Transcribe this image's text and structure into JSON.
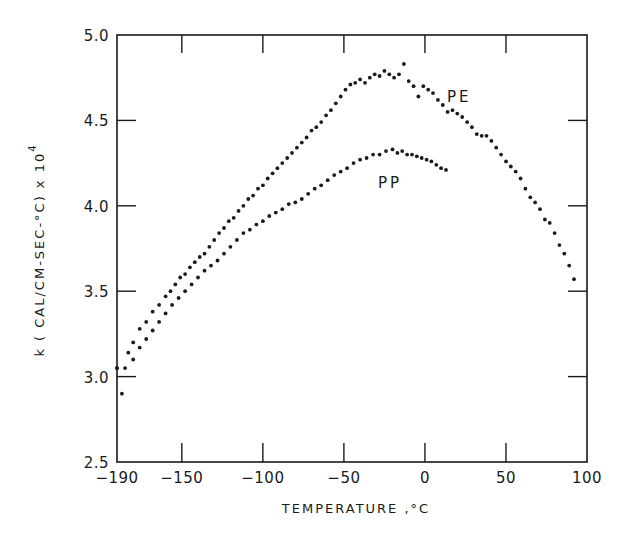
{
  "chart_data": {
    "type": "scatter",
    "title": "",
    "xlabel": "TEMPERATURE, °C",
    "ylabel": "k (CAL/CM-SEC-°C) x 10",
    "ylabel_superscript": "4",
    "xlim": [
      -190,
      100
    ],
    "ylim": [
      2.5,
      5.0
    ],
    "xticks": [
      -190,
      -150,
      -100,
      -50,
      0,
      50,
      100
    ],
    "xtick_labels": [
      "-190",
      "-150",
      "-100",
      "-50",
      "0",
      "50",
      "100"
    ],
    "yticks": [
      2.5,
      3.0,
      3.5,
      4.0,
      4.5,
      5.0
    ],
    "ytick_labels": [
      "2.5",
      "3.0",
      "3.5",
      "4.0",
      "4.5",
      "5.0"
    ],
    "grid": false,
    "legend": "inline labels",
    "series": [
      {
        "name": "PE",
        "label_position": {
          "x": 12,
          "y": 4.68
        },
        "points": [
          [
            -190,
            3.05
          ],
          [
            -187,
            2.9
          ],
          [
            -183,
            3.14
          ],
          [
            -180,
            3.2
          ],
          [
            -176,
            3.28
          ],
          [
            -172,
            3.32
          ],
          [
            -168,
            3.38
          ],
          [
            -164,
            3.42
          ],
          [
            -160,
            3.47
          ],
          [
            -157,
            3.5
          ],
          [
            -154,
            3.54
          ],
          [
            -151,
            3.58
          ],
          [
            -148,
            3.6
          ],
          [
            -145,
            3.64
          ],
          [
            -142,
            3.67
          ],
          [
            -139,
            3.7
          ],
          [
            -136,
            3.72
          ],
          [
            -133,
            3.76
          ],
          [
            -130,
            3.8
          ],
          [
            -127,
            3.84
          ],
          [
            -124,
            3.87
          ],
          [
            -121,
            3.91
          ],
          [
            -118,
            3.93
          ],
          [
            -115,
            3.97
          ],
          [
            -112,
            4.0
          ],
          [
            -109,
            4.04
          ],
          [
            -106,
            4.06
          ],
          [
            -103,
            4.1
          ],
          [
            -100,
            4.12
          ],
          [
            -97,
            4.16
          ],
          [
            -94,
            4.19
          ],
          [
            -91,
            4.22
          ],
          [
            -88,
            4.25
          ],
          [
            -85,
            4.28
          ],
          [
            -82,
            4.31
          ],
          [
            -79,
            4.34
          ],
          [
            -76,
            4.37
          ],
          [
            -73,
            4.4
          ],
          [
            -70,
            4.44
          ],
          [
            -67,
            4.46
          ],
          [
            -64,
            4.49
          ],
          [
            -61,
            4.53
          ],
          [
            -58,
            4.56
          ],
          [
            -55,
            4.6
          ],
          [
            -52,
            4.64
          ],
          [
            -49,
            4.68
          ],
          [
            -46,
            4.71
          ],
          [
            -43,
            4.72
          ],
          [
            -40,
            4.74
          ],
          [
            -37,
            4.72
          ],
          [
            -34,
            4.75
          ],
          [
            -31,
            4.77
          ],
          [
            -28,
            4.76
          ],
          [
            -25,
            4.79
          ],
          [
            -22,
            4.77
          ],
          [
            -19,
            4.75
          ],
          [
            -16,
            4.77
          ],
          [
            -13,
            4.83
          ],
          [
            -10,
            4.73
          ],
          [
            -7,
            4.7
          ],
          [
            -4,
            4.64
          ],
          [
            -1,
            4.7
          ],
          [
            2,
            4.68
          ],
          [
            5,
            4.66
          ],
          [
            8,
            4.62
          ],
          [
            11,
            4.59
          ],
          [
            14,
            4.55
          ],
          [
            17,
            4.56
          ],
          [
            20,
            4.54
          ],
          [
            23,
            4.52
          ],
          [
            26,
            4.49
          ],
          [
            29,
            4.46
          ],
          [
            32,
            4.42
          ],
          [
            35,
            4.41
          ],
          [
            38,
            4.41
          ],
          [
            41,
            4.38
          ],
          [
            44,
            4.34
          ],
          [
            47,
            4.3
          ],
          [
            50,
            4.26
          ],
          [
            53,
            4.23
          ],
          [
            56,
            4.2
          ],
          [
            59,
            4.16
          ],
          [
            62,
            4.1
          ],
          [
            65,
            4.05
          ],
          [
            68,
            4.02
          ],
          [
            71,
            3.98
          ],
          [
            74,
            3.92
          ],
          [
            77,
            3.9
          ],
          [
            80,
            3.84
          ],
          [
            83,
            3.77
          ],
          [
            86,
            3.72
          ],
          [
            89,
            3.65
          ],
          [
            92,
            3.57
          ]
        ]
      },
      {
        "name": "PP",
        "label_position": {
          "x": -23,
          "y": 4.15
        },
        "points": [
          [
            -190,
            3.05
          ],
          [
            -185,
            3.05
          ],
          [
            -180,
            3.1
          ],
          [
            -176,
            3.17
          ],
          [
            -172,
            3.22
          ],
          [
            -168,
            3.27
          ],
          [
            -164,
            3.32
          ],
          [
            -160,
            3.37
          ],
          [
            -156,
            3.42
          ],
          [
            -152,
            3.46
          ],
          [
            -148,
            3.5
          ],
          [
            -144,
            3.54
          ],
          [
            -140,
            3.58
          ],
          [
            -136,
            3.62
          ],
          [
            -132,
            3.65
          ],
          [
            -128,
            3.68
          ],
          [
            -124,
            3.72
          ],
          [
            -120,
            3.76
          ],
          [
            -116,
            3.8
          ],
          [
            -112,
            3.84
          ],
          [
            -108,
            3.86
          ],
          [
            -104,
            3.89
          ],
          [
            -100,
            3.91
          ],
          [
            -96,
            3.94
          ],
          [
            -92,
            3.96
          ],
          [
            -88,
            3.98
          ],
          [
            -84,
            4.01
          ],
          [
            -80,
            4.02
          ],
          [
            -76,
            4.04
          ],
          [
            -72,
            4.07
          ],
          [
            -68,
            4.1
          ],
          [
            -64,
            4.12
          ],
          [
            -60,
            4.15
          ],
          [
            -56,
            4.18
          ],
          [
            -52,
            4.2
          ],
          [
            -48,
            4.22
          ],
          [
            -44,
            4.25
          ],
          [
            -40,
            4.27
          ],
          [
            -36,
            4.28
          ],
          [
            -32,
            4.3
          ],
          [
            -28,
            4.3
          ],
          [
            -24,
            4.32
          ],
          [
            -20,
            4.33
          ],
          [
            -17,
            4.31
          ],
          [
            -14,
            4.32
          ],
          [
            -11,
            4.3
          ],
          [
            -8,
            4.3
          ],
          [
            -5,
            4.29
          ],
          [
            -2,
            4.28
          ],
          [
            1,
            4.27
          ],
          [
            4,
            4.26
          ],
          [
            7,
            4.24
          ],
          [
            10,
            4.22
          ],
          [
            13,
            4.21
          ]
        ]
      }
    ]
  },
  "axes": {
    "x_title": "TEMPERATURE ,°C",
    "y_title": "k ( CAL/CM-SEC-°C) x 10",
    "y_title_sup": "4"
  },
  "labels": {
    "pe": "PE",
    "pp": "PP"
  }
}
